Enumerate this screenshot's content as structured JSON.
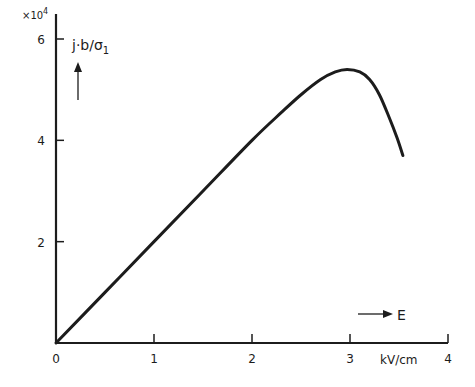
{
  "chart_data": {
    "type": "line",
    "title": "",
    "xlabel": "E",
    "xunit": "kV/cm",
    "ylabel": "j·b/σ₁",
    "y_multiplier": "×10⁴",
    "xlim": [
      0,
      4
    ],
    "ylim": [
      0,
      6
    ],
    "x_ticks": [
      "0",
      "1",
      "2",
      "3",
      "4"
    ],
    "y_ticks": [
      "2",
      "4",
      "6"
    ],
    "grid": false,
    "legend": null,
    "series": [
      {
        "name": "j·b/σ₁",
        "x": [
          0,
          0.5,
          1.0,
          1.5,
          2.0,
          2.3,
          2.5,
          2.7,
          2.85,
          2.97,
          3.1,
          3.2,
          3.3,
          3.4,
          3.48,
          3.54
        ],
        "y": [
          0,
          1.0,
          2.0,
          3.0,
          4.0,
          4.55,
          4.9,
          5.2,
          5.35,
          5.4,
          5.35,
          5.2,
          4.9,
          4.45,
          4.05,
          3.7
        ]
      }
    ]
  },
  "labels": {
    "multiplier_base": "×10",
    "multiplier_exp": "4",
    "y_axis_label": "j·b/σ",
    "y_axis_sub": "1",
    "x_axis_symbol": "E",
    "x_unit": "kV/cm"
  },
  "colors": {
    "ink": "#1c1c1c",
    "background": "#ffffff"
  }
}
